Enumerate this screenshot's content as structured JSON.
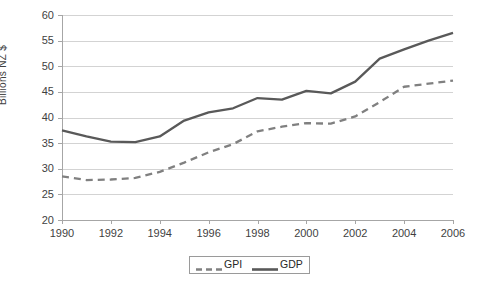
{
  "chart_data": {
    "type": "line",
    "title": "",
    "xlabel": "",
    "ylabel": "Billions  NZ $",
    "x": [
      1990,
      1991,
      1992,
      1993,
      1994,
      1995,
      1996,
      1997,
      1998,
      1999,
      2000,
      2001,
      2002,
      2003,
      2004,
      2005,
      2006
    ],
    "xticklabels": [
      "1990",
      "1992",
      "1994",
      "1996",
      "1998",
      "2000",
      "2002",
      "2004",
      "2006"
    ],
    "xticks": [
      1990,
      1992,
      1994,
      1996,
      1998,
      2000,
      2002,
      2004,
      2006
    ],
    "xlim": [
      1990,
      2006
    ],
    "ylim": [
      20,
      60
    ],
    "yticks": [
      20,
      25,
      30,
      35,
      40,
      45,
      50,
      55,
      60
    ],
    "yticklabels": [
      "20",
      "25",
      "30",
      "35",
      "40",
      "45",
      "50",
      "55",
      "60"
    ],
    "grid": "horizontal",
    "legend_position": "bottom-center",
    "series": [
      {
        "name": "GPI",
        "style": "dashed",
        "color": "#808080",
        "values": [
          28.5,
          27.8,
          27.9,
          28.2,
          29.4,
          31.2,
          33.2,
          34.8,
          37.3,
          38.2,
          38.9,
          38.8,
          40.2,
          43.0,
          46.0,
          46.6,
          47.2
        ]
      },
      {
        "name": "GDP",
        "style": "solid",
        "color": "#595959",
        "values": [
          37.5,
          36.3,
          35.3,
          35.2,
          36.3,
          39.4,
          41.0,
          41.8,
          43.8,
          43.5,
          45.2,
          44.7,
          47.0,
          51.5,
          53.3,
          55.0,
          56.5
        ]
      }
    ]
  },
  "legend": {
    "items": [
      {
        "label": "GPI",
        "swatch": "dashed-line-swatch"
      },
      {
        "label": "GDP",
        "swatch": "solid-line-swatch"
      }
    ]
  },
  "colors": {
    "gpi": "#808080",
    "gdp": "#595959",
    "gridline": "#d3d3d3",
    "axis": "#a6a6a6",
    "text": "#3f3f3f",
    "background": "#ffffff"
  }
}
